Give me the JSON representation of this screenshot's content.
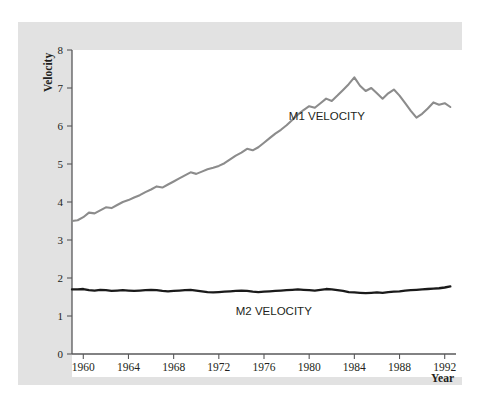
{
  "figure": {
    "background_color": "#e2e2e2",
    "plot_background_color": "#ffffff",
    "y_axis_title": "Velocity",
    "x_axis_title": "Year"
  },
  "labels": {
    "m1": "M1 VELOCITY",
    "m2": "M2 VELOCITY"
  },
  "chart_data": {
    "type": "line",
    "title": "",
    "xlabel": "Year",
    "ylabel": "Velocity",
    "xlim": [
      1959,
      1993
    ],
    "ylim": [
      0,
      8
    ],
    "xticks": [
      1960,
      1964,
      1968,
      1972,
      1976,
      1980,
      1984,
      1988,
      1992
    ],
    "yticks": [
      0,
      1,
      2,
      3,
      4,
      5,
      6,
      7,
      8
    ],
    "grid": false,
    "legend": "inline-annotations",
    "colors": {
      "m1": "#8c8c8c",
      "m2": "#1a1a1a"
    },
    "x": [
      1959,
      1959.5,
      1960,
      1960.5,
      1961,
      1961.5,
      1962,
      1962.5,
      1963,
      1963.5,
      1964,
      1964.5,
      1965,
      1965.5,
      1966,
      1966.5,
      1967,
      1967.5,
      1968,
      1968.5,
      1969,
      1969.5,
      1970,
      1970.5,
      1971,
      1971.5,
      1972,
      1972.5,
      1973,
      1973.5,
      1974,
      1974.5,
      1975,
      1975.5,
      1976,
      1976.5,
      1977,
      1977.5,
      1978,
      1978.5,
      1979,
      1979.5,
      1980,
      1980.5,
      1981,
      1981.5,
      1982,
      1982.5,
      1983,
      1983.5,
      1984,
      1984.5,
      1985,
      1985.5,
      1986,
      1986.5,
      1987,
      1987.5,
      1988,
      1988.5,
      1989,
      1989.5,
      1990,
      1990.5,
      1991,
      1991.5,
      1992,
      1992.5
    ],
    "series": [
      {
        "name": "M1 VELOCITY",
        "values": [
          3.5,
          3.52,
          3.6,
          3.72,
          3.7,
          3.78,
          3.86,
          3.84,
          3.92,
          4.0,
          4.05,
          4.12,
          4.18,
          4.26,
          4.33,
          4.41,
          4.38,
          4.46,
          4.54,
          4.62,
          4.7,
          4.78,
          4.74,
          4.8,
          4.86,
          4.9,
          4.95,
          5.02,
          5.12,
          5.22,
          5.3,
          5.4,
          5.36,
          5.44,
          5.56,
          5.68,
          5.8,
          5.9,
          6.02,
          6.16,
          6.3,
          6.42,
          6.52,
          6.48,
          6.6,
          6.72,
          6.66,
          6.8,
          6.95,
          7.1,
          7.28,
          7.06,
          6.92,
          7.0,
          6.86,
          6.72,
          6.86,
          6.96,
          6.8,
          6.6,
          6.4,
          6.22,
          6.32,
          6.46,
          6.62,
          6.56,
          6.6,
          6.5
        ]
      },
      {
        "name": "M2 VELOCITY",
        "values": [
          1.7,
          1.7,
          1.71,
          1.68,
          1.67,
          1.69,
          1.68,
          1.66,
          1.67,
          1.68,
          1.67,
          1.66,
          1.67,
          1.68,
          1.69,
          1.68,
          1.66,
          1.65,
          1.66,
          1.67,
          1.68,
          1.69,
          1.67,
          1.65,
          1.63,
          1.62,
          1.63,
          1.64,
          1.65,
          1.66,
          1.67,
          1.66,
          1.64,
          1.63,
          1.64,
          1.65,
          1.66,
          1.67,
          1.68,
          1.69,
          1.7,
          1.69,
          1.68,
          1.67,
          1.69,
          1.71,
          1.7,
          1.68,
          1.66,
          1.63,
          1.62,
          1.61,
          1.6,
          1.61,
          1.62,
          1.61,
          1.63,
          1.64,
          1.65,
          1.67,
          1.68,
          1.69,
          1.7,
          1.71,
          1.72,
          1.73,
          1.75,
          1.78
        ]
      }
    ],
    "annotations": [
      {
        "text": "M1 VELOCITY",
        "x": 1978.2,
        "y": 6.15
      },
      {
        "text": "M2 VELOCITY",
        "x": 1973.5,
        "y": 1.02
      }
    ]
  }
}
